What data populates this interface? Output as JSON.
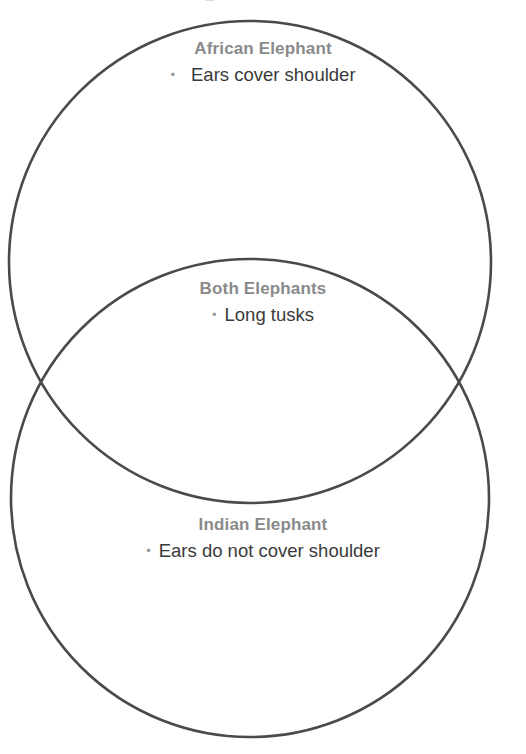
{
  "diagram": {
    "type": "venn-2-set-vertical",
    "background_color": "#ffffff",
    "stroke_color": "#4a4a4a",
    "title_color": "#8a8a8a",
    "body_color": "#3a3a3a",
    "bullet_glyph": "•",
    "circles": [
      {
        "name": "top-circle",
        "cx": 250,
        "cy": 262,
        "r": 241
      },
      {
        "name": "bottom-circle",
        "cx": 250,
        "cy": 498,
        "r": 239
      }
    ],
    "regions": {
      "left": {
        "id": "african-elephant",
        "title": "African Elephant",
        "items": [
          "Ears cover shoulder"
        ]
      },
      "overlap": {
        "id": "both-elephants",
        "title": "Both Elephants",
        "items": [
          "Long tusks"
        ]
      },
      "right": {
        "id": "indian-elephant",
        "title": "Indian Elephant",
        "items": [
          "Ears do not cover shoulder"
        ]
      }
    }
  }
}
